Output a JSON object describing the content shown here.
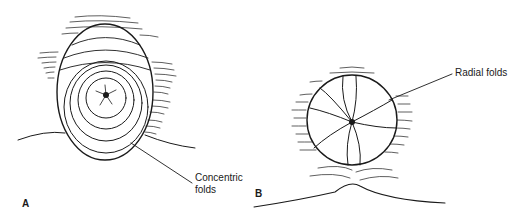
{
  "figure": {
    "panels": [
      {
        "id": "A",
        "letter": "A",
        "annotation": {
          "line1": "Concentric",
          "line2": "folds"
        },
        "shape": "oval with concentric folds around central opening"
      },
      {
        "id": "B",
        "letter": "B",
        "annotation": {
          "line1": "Radial folds"
        },
        "shape": "round with radial folds converging to center"
      }
    ],
    "colors": {
      "ink": "#1a1a1a",
      "background": "#ffffff"
    }
  }
}
